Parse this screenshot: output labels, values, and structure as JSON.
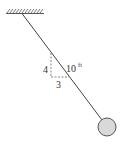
{
  "diagram": {
    "type": "pendulum",
    "support": {
      "x1": 6,
      "x2": 44,
      "y": 13
    },
    "rod": {
      "x1": 22,
      "y1": 13,
      "x2": 102,
      "y2": 119,
      "color": "#444444"
    },
    "bob": {
      "cx": 107,
      "cy": 127,
      "r": 9,
      "fill": "#d9d9d9",
      "stroke": "#555555"
    },
    "slope_triangle": {
      "vertical_label": "4",
      "horizontal_label": "3"
    },
    "length_label": "10",
    "length_unit": "ft"
  }
}
